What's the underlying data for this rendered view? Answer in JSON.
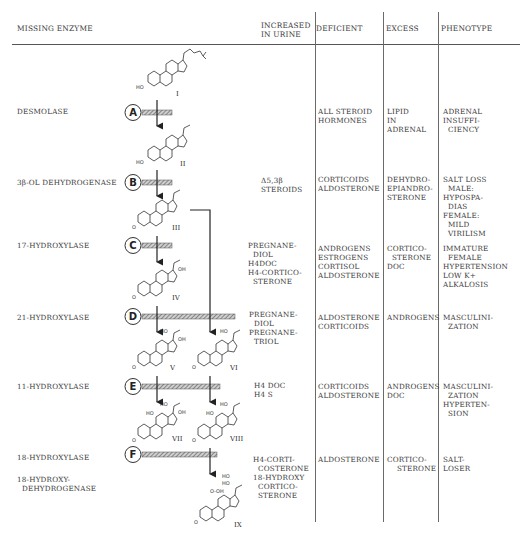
{
  "header": {
    "missing_enzyme": "MISSING ENZYME",
    "increased_in_urine": "INCREASED\nIN URINE",
    "deficient": "DEFICIENT",
    "excess": "EXCESS",
    "phenotype": "PHENOTYPE"
  },
  "compound_labels": [
    "I",
    "II",
    "III",
    "IV",
    "V",
    "VI",
    "VII",
    "VIII",
    "IX"
  ],
  "block_markers": [
    "A",
    "B",
    "C",
    "D",
    "E",
    "F"
  ],
  "rows": [
    {
      "marker": "A",
      "enzyme": "DESMOLASE",
      "urine": "",
      "deficient": "ALL STEROID\nHORMONES",
      "excess": "LIPID\nIN\nADRENAL",
      "phenotype": "ADRENAL\nINSUFFI-\n  CIENCY"
    },
    {
      "marker": "B",
      "enzyme": "3β-OL DEHYDROGENASE",
      "urine": "Δ5,3β\nSTEROIDS",
      "deficient": "CORTICOIDS\nALDOSTERONE",
      "excess": "DEHYDRO-\nEPIANDRO-\nSTERONE",
      "phenotype": "SALT LOSS\n  MALE:\nHYPOSPA-\n  DIAS\nFEMALE:\n  MILD\n  VIRILISM"
    },
    {
      "marker": "C",
      "enzyme": "17-HYDROXYLASE",
      "urine": "PREGNANE-\n  DIOL\nH4DOC\nH4-CORTICO-\n  STERONE",
      "deficient": "ANDROGENS\nESTROGENS\nCORTISOL\nALDOSTERONE",
      "excess": "CORTICO-\n  STERONE\nDOC",
      "phenotype": "IMMATURE\n  FEMALE\nHYPERTENSION\nLOW K+\nALKALOSIS"
    },
    {
      "marker": "D",
      "enzyme": "21-HYDROXYLASE",
      "urine": "PREGNANE-\n  DIOL\nPREGNANE-\n  TRIOL",
      "deficient": "ALDOSTERONE\nCORTICOIDS",
      "excess": "ANDROGENS",
      "phenotype": "MASCULINI-\n  ZATION"
    },
    {
      "marker": "E",
      "enzyme": "11-HYDROXYLASE",
      "urine": "H4 DOC\nH4 S",
      "deficient": "CORTICOIDS\nALDOSTERONE",
      "excess": "ANDROGENS\nDOC",
      "phenotype": "MASCULINI-\n  ZATION\nHYPERTEN-\n  SION"
    },
    {
      "marker": "F",
      "enzyme": "18-HYDROXYLASE",
      "enzyme2": "18-HYDROXY-\n  DEHYDROGENASE",
      "urine": "H4-CORTI-\n  COSTERONE\n18-HYDROXY\n  CORTICO-\n  STERONE",
      "deficient": "ALDOSTERONE",
      "excess": "CORTICO-\n    STERONE",
      "phenotype": "SALT-\nLOSER"
    }
  ],
  "structure_groups": {
    "HO": "HO",
    "O": "O",
    "OH": "OH"
  },
  "colors": {
    "ink": "#333333",
    "rule": "#555555",
    "hatch": "#777777"
  }
}
